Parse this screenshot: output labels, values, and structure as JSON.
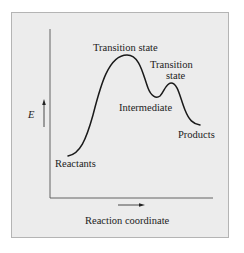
{
  "diagram": {
    "axes": {
      "y_label": "E",
      "x_label": "Reaction coordinate"
    },
    "labels": {
      "reactants": "Reactants",
      "transition_state_1": "Transition state",
      "transition_state_2_line1": "Transition",
      "transition_state_2_line2": "state",
      "intermediate": "Intermediate",
      "products": "Products"
    },
    "colors": {
      "panel_fill": "#ececec",
      "panel_border": "#b4b4b4",
      "stroke": "#1a1a1a",
      "axis": "#555555"
    }
  }
}
